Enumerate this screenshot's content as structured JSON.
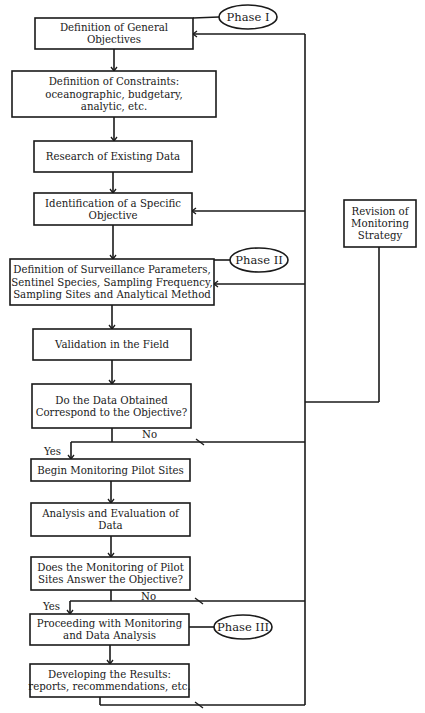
{
  "diagram": {
    "colors": {
      "line": "#1a1a1a",
      "background": "#ffffff"
    },
    "boxes": [
      {
        "id": "general-objectives",
        "lines": [
          "Definition of General",
          "Objectives"
        ],
        "x": 35,
        "y": 18,
        "w": 158,
        "h": 31
      },
      {
        "id": "constraints",
        "lines": [
          "Definition of Constraints:",
          "oceanographic, budgetary,",
          "analytic, etc."
        ],
        "x": 12,
        "y": 71,
        "w": 204,
        "h": 46
      },
      {
        "id": "research-existing-data",
        "lines": [
          "Research of Existing Data"
        ],
        "x": 34,
        "y": 141,
        "w": 158,
        "h": 31
      },
      {
        "id": "specific-objective",
        "lines": [
          "Identification of a Specific",
          "Objective"
        ],
        "x": 34,
        "y": 193,
        "w": 158,
        "h": 32
      },
      {
        "id": "surveillance-parameters",
        "lines": [
          "Definition of Surveillance Parameters,",
          "Sentinel Species, Sampling Frequency,",
          "Sampling Sites and Analytical Method"
        ],
        "x": 10,
        "y": 259,
        "w": 204,
        "h": 46
      },
      {
        "id": "field-validation",
        "lines": [
          "Validation in the Field"
        ],
        "x": 33,
        "y": 329,
        "w": 158,
        "h": 31
      },
      {
        "id": "data-correspond-question",
        "lines": [
          "Do the Data Obtained",
          "Correspond to the Objective?"
        ],
        "x": 32,
        "y": 384,
        "w": 159,
        "h": 44
      },
      {
        "id": "begin-pilot-sites",
        "lines": [
          "Begin Monitoring Pilot Sites"
        ],
        "x": 31,
        "y": 459,
        "w": 159,
        "h": 22
      },
      {
        "id": "analysis-evaluation",
        "lines": [
          "Analysis and Evaluation of",
          "Data"
        ],
        "x": 31,
        "y": 503,
        "w": 159,
        "h": 33
      },
      {
        "id": "pilot-answer-question",
        "lines": [
          "Does the Monitoring of Pilot",
          "Sites Answer the Objective?"
        ],
        "x": 31,
        "y": 557,
        "w": 159,
        "h": 33
      },
      {
        "id": "proceed-monitoring",
        "lines": [
          "Proceeding with Monitoring",
          "and Data Analysis"
        ],
        "x": 30,
        "y": 614,
        "w": 159,
        "h": 31
      },
      {
        "id": "developing-results",
        "lines": [
          "Developing the Results:",
          "reports, recommendations, etc."
        ],
        "x": 30,
        "y": 664,
        "w": 159,
        "h": 33
      }
    ],
    "revision_box": {
      "id": "revision-strategy",
      "lines": [
        "Revision of",
        "Monitoring",
        "Strategy"
      ],
      "x": 344,
      "y": 200,
      "w": 72,
      "h": 47
    },
    "phases": [
      {
        "id": "phase-1",
        "label": "Phase I",
        "cx": 248,
        "cy": 17,
        "rx": 29,
        "ry": 12,
        "attach_x": 193,
        "attach_y": 18
      },
      {
        "id": "phase-2",
        "label": "Phase II",
        "cx": 259,
        "cy": 260,
        "rx": 29,
        "ry": 12,
        "attach_x": 214,
        "attach_y": 260
      },
      {
        "id": "phase-3",
        "label": "Phase III",
        "cx": 243,
        "cy": 627,
        "rx": 29,
        "ry": 12,
        "attach_x": 189,
        "attach_y": 627
      }
    ],
    "decisions": [
      {
        "id": "decision-1",
        "yes_label": "Yes",
        "no_label": "No",
        "branch_y": 442,
        "yes_x": 71,
        "stem_x": 112,
        "no_label_x": 142,
        "no_label_y": 438,
        "yes_label_x": 44,
        "yes_label_y": 455,
        "arrow_x": 200
      },
      {
        "id": "decision-2",
        "yes_label": "Yes",
        "no_label": "No",
        "branch_y": 601,
        "yes_x": 70,
        "stem_x": 111,
        "no_label_x": 141,
        "no_label_y": 600,
        "yes_label_x": 43,
        "yes_label_y": 610,
        "arrow_x": 199
      }
    ],
    "feedback": {
      "main_x": 305,
      "top_y": 34,
      "bottom_y": 705,
      "bottom_arrow_x": 199,
      "revision_stem_x": 379,
      "revision_join_y": 402,
      "return_targets": [
        {
          "id": "to-general-objectives",
          "y": 34,
          "to_x": 193
        },
        {
          "id": "to-specific-objective",
          "y": 211,
          "to_x": 192
        },
        {
          "id": "to-surveillance-parameters",
          "y": 284,
          "to_x": 214
        }
      ]
    }
  }
}
